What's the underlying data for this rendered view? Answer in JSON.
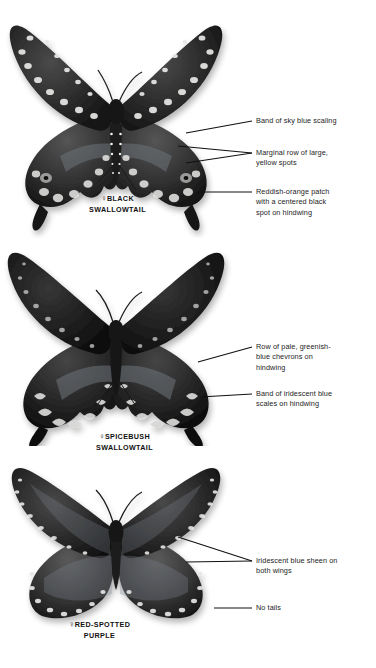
{
  "figure": {
    "type": "identification-plate",
    "background": "#ffffff",
    "rendering": "grayscale photographic plate",
    "text_color": "#1d1d1d"
  },
  "specimens": [
    {
      "id": "black-swallowtail",
      "sex_symbol": "♀",
      "common_name_line1": "BLACK",
      "common_name_line2": "SWALLOWTAIL",
      "tails": "present",
      "notes": "Two rows of pale yellow spots on forewings; blue scaling band and orange patch on hindwing"
    },
    {
      "id": "spicebush-swallowtail",
      "sex_symbol": "♀",
      "common_name_line1": "SPICEBUSH",
      "common_name_line2": "SWALLOWTAIL",
      "tails": "present",
      "notes": "Darker overall; pale greenish-blue chevrons along hindwing margin"
    },
    {
      "id": "red-spotted-purple",
      "sex_symbol": "♀",
      "common_name_line1": "RED-SPOTTED",
      "common_name_line2": "PURPLE",
      "tails": "absent",
      "notes": "Rounded wings, no tails, iridescent blue sheen, white-dashed margins"
    }
  ],
  "callouts": [
    {
      "id": "blue-scaling",
      "lines": [
        "Band of sky blue scaling"
      ],
      "leader": "single",
      "points_to": "black-swallowtail hindwing"
    },
    {
      "id": "yellow-spots",
      "lines": [
        "Marginal row of large,",
        "yellow spots"
      ],
      "leader": "forked",
      "points_to": "black-swallowtail hindwing margin"
    },
    {
      "id": "orange-patch",
      "lines": [
        "Reddish-orange patch",
        "with a centered black",
        "spot on hindwing"
      ],
      "leader": "single",
      "points_to": "black-swallowtail hindwing"
    },
    {
      "id": "chevrons",
      "lines": [
        "Row of pale, greenish-",
        "blue chevrons on",
        "hindwing"
      ],
      "leader": "single",
      "points_to": "spicebush-swallowtail hindwing"
    },
    {
      "id": "iridescent-band",
      "lines": [
        "Band of iridescent blue",
        "scales on hindwing"
      ],
      "leader": "single",
      "points_to": "spicebush-swallowtail hindwing"
    },
    {
      "id": "blue-sheen",
      "lines": [
        "Iridescent blue sheen on",
        "both wings"
      ],
      "leader": "forked",
      "points_to": "red-spotted-purple forewing and hindwing"
    },
    {
      "id": "no-tails",
      "lines": [
        "No tails"
      ],
      "leader": "single",
      "points_to": "red-spotted-purple hindwing margin"
    }
  ]
}
